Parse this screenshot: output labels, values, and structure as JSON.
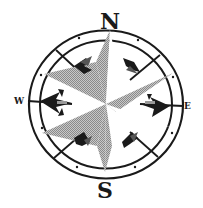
{
  "image": {
    "subject": "Compass rose",
    "colors": {
      "background": "#ffffff",
      "ink": "#1a1a1a",
      "star_fill": "#a6a6a6"
    }
  },
  "compass": {
    "labels": {
      "north": "N",
      "south": "S",
      "west": "W",
      "east": "E"
    }
  }
}
